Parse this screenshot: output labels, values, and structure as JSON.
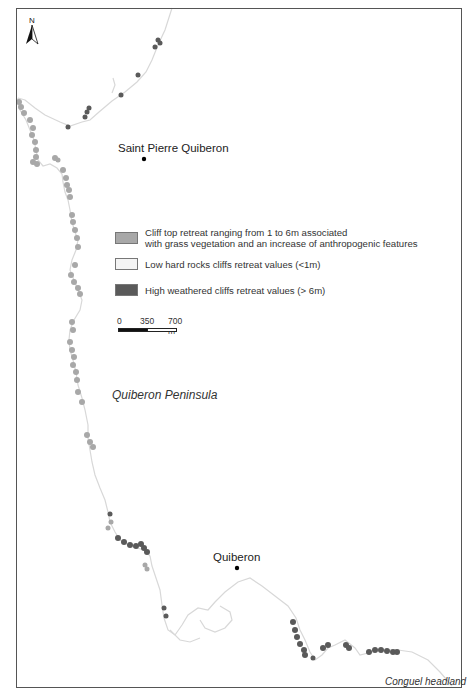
{
  "map": {
    "north_arrow": {
      "label": "N"
    },
    "places": {
      "saint_pierre": "Saint Pierre Quiberon",
      "quiberon": "Quiberon",
      "peninsula": "Quiberon Peninsula",
      "headland": "Conguel headland"
    },
    "legend": {
      "items": [
        {
          "label_line1": "Cliff top retreat ranging from 1 to 6m associated",
          "label_line2": "with grass vegetation and an increase of anthropogenic features",
          "color": "#a8a8a8"
        },
        {
          "label_line1": "Low hard rocks cliffs retreat values (<1m)",
          "label_line2": "",
          "color": "#f4f4f4"
        },
        {
          "label_line1": "High weathered cliffs retreat values (> 6m)",
          "label_line2": "",
          "color": "#5a5a5a"
        }
      ]
    },
    "scale_bar": {
      "tick0": "0",
      "tick1": "350",
      "tick2": "700 m"
    },
    "colors": {
      "coastline": "#d6d6d6",
      "medium_retreat": "#a8a8a8",
      "high_retreat": "#5a5a5a",
      "frame": "#555555"
    }
  }
}
